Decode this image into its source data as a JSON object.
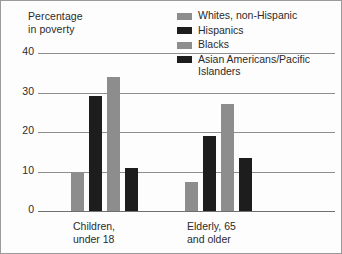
{
  "chart_data": {
    "type": "bar",
    "title": "Percentage in poverty",
    "ylabel": "Percentage in poverty",
    "xlabel": "",
    "ylim": [
      0,
      40
    ],
    "yticks": [
      0,
      10,
      20,
      30,
      40
    ],
    "grid": true,
    "legend_position": "top-right",
    "categories": [
      "Children,\nunder 18",
      "Elderly, 65\nand older"
    ],
    "series": [
      {
        "name": "Whites, non-Hispanic",
        "color": "#8d8d8d",
        "values": [
          9.5,
          7.3
        ]
      },
      {
        "name": "Hispanics",
        "color": "#1d1d1d",
        "values": [
          29.0,
          19.0
        ]
      },
      {
        "name": "Blacks",
        "color": "#8d8d8d",
        "values": [
          34.0,
          27.0
        ]
      },
      {
        "name": "Asian Americans/Pacific\nIslanders",
        "color": "#1d1d1d",
        "values": [
          11.0,
          13.4
        ]
      }
    ]
  },
  "axis_title": {
    "text": "Percentage\nin poverty"
  },
  "yaxis": {
    "ticks": [
      "40",
      "30",
      "20",
      "10",
      "0"
    ]
  },
  "categories": [
    {
      "label": "Children,\nunder 18"
    },
    {
      "label": "Elderly, 65\nand older"
    }
  ],
  "legend": {
    "items": [
      {
        "label": "Whites, non-Hispanic",
        "color": "#8d8d8d"
      },
      {
        "label": "Hispanics",
        "color": "#1d1d1d"
      },
      {
        "label": "Blacks",
        "color": "#8d8d8d"
      },
      {
        "label": "Asian Americans/Pacific\nIslanders",
        "color": "#1d1d1d"
      }
    ]
  }
}
